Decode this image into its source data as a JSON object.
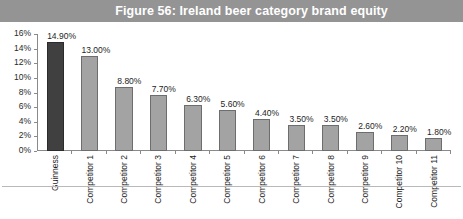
{
  "figure": {
    "title": "Figure 56: Ireland beer category brand equity",
    "banner_color": "#949494",
    "title_color": "#ffffff"
  },
  "chart_data": {
    "type": "bar",
    "title": "Figure 56: Ireland beer category brand equity",
    "xlabel": "",
    "ylabel": "",
    "ylim": [
      0,
      16
    ],
    "grid": false,
    "legend": "none",
    "y_ticks": [
      "0%",
      "2%",
      "4%",
      "6%",
      "8%",
      "10%",
      "12%",
      "14%",
      "16%"
    ],
    "y_tick_values": [
      0,
      2,
      4,
      6,
      8,
      10,
      12,
      14,
      16
    ],
    "categories": [
      "Guinness",
      "Competitor 1",
      "Competitor 2",
      "Competitor 3",
      "Competitor 4",
      "Competitor 5",
      "Competitor 6",
      "Competitor 7",
      "Competitor 8",
      "Competitor 9",
      "Competitor 10",
      "Competitor 11"
    ],
    "values": [
      14.9,
      13.0,
      8.8,
      7.7,
      6.3,
      5.6,
      4.4,
      3.5,
      3.5,
      2.6,
      2.2,
      1.8
    ],
    "data_labels": [
      "14.90%",
      "13.00%",
      "8.80%",
      "7.70%",
      "6.30%",
      "5.60%",
      "4.40%",
      "3.50%",
      "3.50%",
      "2.60%",
      "2.20%",
      "1.80%"
    ],
    "highlight_index": 0,
    "bar_color": "#a3a3a3",
    "bar_border_color": "#6d6d6d",
    "highlight_color": "#404040",
    "highlight_border_color": "#2b2b2b"
  }
}
